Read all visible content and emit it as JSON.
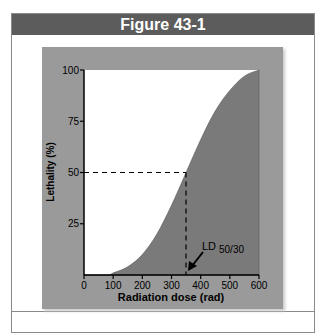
{
  "figure": {
    "title": "Figure 43-1"
  },
  "chart_data": {
    "type": "area",
    "title": "Figure 43-1",
    "xlabel": "Radiation dose (rad)",
    "ylabel": "Lethality (%)",
    "x_ticks": [
      "0",
      "100",
      "200",
      "300",
      "400",
      "500",
      "600"
    ],
    "y_ticks": [
      "25",
      "50",
      "75",
      "100"
    ],
    "xlim": [
      0,
      600
    ],
    "ylim": [
      0,
      100
    ],
    "grid": false,
    "series": [
      {
        "name": "Lethality curve",
        "x": [
          0,
          80,
          100,
          150,
          200,
          250,
          300,
          350,
          400,
          450,
          500,
          550,
          600
        ],
        "y": [
          0,
          0,
          1,
          4,
          10,
          20,
          34,
          50,
          66,
          80,
          90,
          97,
          100
        ]
      }
    ],
    "annotations": [
      {
        "text": "LD 50/30",
        "x": 350,
        "y": 50,
        "note": "dashed reference lines at 50% and ~350 rad"
      }
    ],
    "colors": {
      "fill": "#7a7a7a",
      "panel": "#9a9a9a",
      "plot_bg": "#ffffff"
    }
  },
  "labels": {
    "annotation_ld": "LD",
    "annotation_sub": "50/30"
  }
}
